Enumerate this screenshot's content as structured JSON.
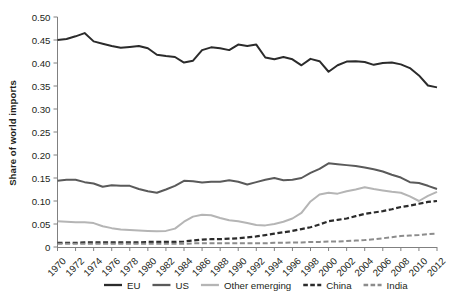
{
  "chart_data": {
    "type": "line",
    "title": "",
    "xlabel": "",
    "ylabel": "Share of world imports",
    "xlim": [
      1970,
      2012
    ],
    "ylim": [
      0,
      0.5
    ],
    "grid": false,
    "legend_position": "bottom",
    "ytick_labels": [
      "0.50",
      "0.45",
      "0.40",
      "0.35",
      "0.30",
      "0.25",
      "0.20",
      "0.15",
      "0.10",
      "0.05",
      "0"
    ],
    "ytick_values": [
      0.5,
      0.45,
      0.4,
      0.35,
      0.3,
      0.25,
      0.2,
      0.15,
      0.1,
      0.05,
      0
    ],
    "xtick_labels": [
      "1970",
      "1972",
      "1974",
      "1976",
      "1978",
      "1980",
      "1982",
      "1984",
      "1986",
      "1988",
      "1990",
      "1992",
      "1994",
      "1996",
      "1998",
      "2000",
      "2002",
      "2004",
      "2006",
      "2008",
      "2010",
      "2012"
    ],
    "xtick_values": [
      1970,
      1972,
      1974,
      1976,
      1978,
      1980,
      1982,
      1984,
      1986,
      1988,
      1990,
      1992,
      1994,
      1996,
      1998,
      2000,
      2002,
      2004,
      2006,
      2008,
      2010,
      2012
    ],
    "x": [
      1970,
      1971,
      1972,
      1973,
      1974,
      1975,
      1976,
      1977,
      1978,
      1979,
      1980,
      1981,
      1982,
      1983,
      1984,
      1985,
      1986,
      1987,
      1988,
      1989,
      1990,
      1991,
      1992,
      1993,
      1994,
      1995,
      1996,
      1997,
      1998,
      1999,
      2000,
      2001,
      2002,
      2003,
      2004,
      2005,
      2006,
      2007,
      2008,
      2009,
      2010,
      2011,
      2012
    ],
    "series": [
      {
        "name": "EU",
        "color": "#2b2b2b",
        "style": "solid",
        "width": 2.0,
        "values": [
          0.45,
          0.452,
          0.458,
          0.465,
          0.447,
          0.442,
          0.437,
          0.433,
          0.435,
          0.437,
          0.432,
          0.418,
          0.415,
          0.413,
          0.401,
          0.405,
          0.428,
          0.434,
          0.432,
          0.428,
          0.44,
          0.437,
          0.44,
          0.412,
          0.408,
          0.413,
          0.408,
          0.395,
          0.409,
          0.404,
          0.381,
          0.395,
          0.403,
          0.404,
          0.402,
          0.396,
          0.4,
          0.401,
          0.397,
          0.389,
          0.373,
          0.351,
          0.347
        ]
      },
      {
        "name": "US",
        "color": "#5a5a5a",
        "style": "solid",
        "width": 2.0,
        "values": [
          0.144,
          0.146,
          0.146,
          0.141,
          0.138,
          0.131,
          0.134,
          0.133,
          0.133,
          0.126,
          0.121,
          0.118,
          0.125,
          0.133,
          0.144,
          0.143,
          0.14,
          0.142,
          0.142,
          0.145,
          0.142,
          0.136,
          0.141,
          0.146,
          0.15,
          0.145,
          0.146,
          0.15,
          0.161,
          0.17,
          0.182,
          0.18,
          0.178,
          0.176,
          0.173,
          0.169,
          0.164,
          0.157,
          0.151,
          0.141,
          0.139,
          0.133,
          0.126
        ]
      },
      {
        "name": "Other emerging",
        "color": "#b5b5b5",
        "style": "solid",
        "width": 2.0,
        "values": [
          0.056,
          0.055,
          0.054,
          0.054,
          0.052,
          0.045,
          0.041,
          0.038,
          0.037,
          0.036,
          0.035,
          0.034,
          0.035,
          0.04,
          0.055,
          0.066,
          0.07,
          0.069,
          0.063,
          0.058,
          0.056,
          0.052,
          0.048,
          0.047,
          0.05,
          0.055,
          0.062,
          0.074,
          0.099,
          0.114,
          0.118,
          0.116,
          0.121,
          0.125,
          0.13,
          0.126,
          0.123,
          0.12,
          0.118,
          0.11,
          0.1,
          0.111,
          0.12
        ]
      },
      {
        "name": "China",
        "color": "#2b2b2b",
        "style": "dashed",
        "width": 2.2,
        "values": [
          0.009,
          0.009,
          0.009,
          0.01,
          0.01,
          0.01,
          0.01,
          0.01,
          0.01,
          0.01,
          0.011,
          0.011,
          0.011,
          0.011,
          0.012,
          0.014,
          0.016,
          0.017,
          0.017,
          0.018,
          0.019,
          0.021,
          0.023,
          0.026,
          0.029,
          0.032,
          0.035,
          0.039,
          0.043,
          0.049,
          0.056,
          0.059,
          0.062,
          0.067,
          0.072,
          0.075,
          0.078,
          0.082,
          0.087,
          0.09,
          0.094,
          0.098,
          0.1
        ]
      },
      {
        "name": "India",
        "color": "#8c8c8c",
        "style": "dashed",
        "width": 2.0,
        "values": [
          0.007,
          0.007,
          0.007,
          0.007,
          0.007,
          0.007,
          0.007,
          0.007,
          0.007,
          0.007,
          0.007,
          0.007,
          0.007,
          0.007,
          0.007,
          0.008,
          0.008,
          0.008,
          0.008,
          0.008,
          0.008,
          0.008,
          0.008,
          0.008,
          0.009,
          0.009,
          0.01,
          0.01,
          0.011,
          0.011,
          0.012,
          0.012,
          0.013,
          0.014,
          0.015,
          0.017,
          0.019,
          0.021,
          0.024,
          0.025,
          0.026,
          0.028,
          0.029
        ]
      }
    ]
  },
  "axis": {
    "ylabel": "Share of world imports"
  },
  "legend": {
    "items": [
      {
        "label": "EU"
      },
      {
        "label": "US"
      },
      {
        "label": "Other emerging"
      },
      {
        "label": "China"
      },
      {
        "label": "India"
      }
    ]
  }
}
